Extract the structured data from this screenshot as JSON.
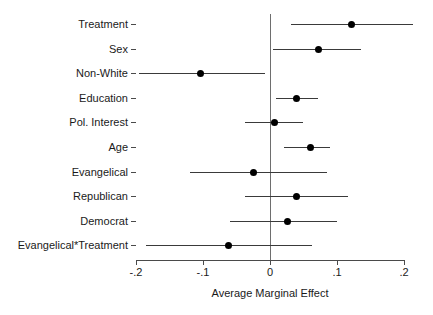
{
  "chart_data": {
    "type": "scatter",
    "title": "",
    "subtitle": "",
    "xlabel": "Average Marginal Effect",
    "ylabel": "",
    "xlim": [
      -0.2,
      0.2
    ],
    "xticks": [
      -0.2,
      -0.1,
      0,
      0.1,
      0.2
    ],
    "xticklabels": [
      "-.2",
      "-.1",
      "0",
      ".1",
      ".2"
    ],
    "grid": false,
    "legend": null,
    "annotations": [
      "vertical reference line at x = 0"
    ],
    "marker_color": "#000000",
    "line_color": "#3a3a3a",
    "axis_color": "#4a4a4a",
    "categories": [
      "Treatment",
      "Sex",
      "Non-White",
      "Education",
      "Pol. Interest",
      "Age",
      "Evangelical",
      "Republican",
      "Democrat",
      "Evangelical*Treatment"
    ],
    "series": [
      {
        "name": "Average Marginal Effect",
        "values": [
          0.122,
          0.072,
          -0.103,
          0.039,
          0.007,
          0.06,
          -0.024,
          0.04,
          0.026,
          -0.062
        ],
        "ci_low": [
          0.031,
          0.005,
          -0.196,
          0.009,
          -0.037,
          0.021,
          -0.12,
          -0.037,
          -0.059,
          -0.185
        ],
        "ci_high": [
          0.213,
          0.136,
          -0.007,
          0.071,
          0.049,
          0.09,
          0.085,
          0.116,
          0.1,
          0.062
        ]
      }
    ],
    "points": [
      {
        "label": "Treatment",
        "estimate": 0.122,
        "ci_low": 0.031,
        "ci_high": 0.213
      },
      {
        "label": "Sex",
        "estimate": 0.072,
        "ci_low": 0.005,
        "ci_high": 0.136
      },
      {
        "label": "Non-White",
        "estimate": -0.103,
        "ci_low": -0.196,
        "ci_high": -0.007
      },
      {
        "label": "Education",
        "estimate": 0.039,
        "ci_low": 0.009,
        "ci_high": 0.071
      },
      {
        "label": "Pol. Interest",
        "estimate": 0.007,
        "ci_low": -0.037,
        "ci_high": 0.049
      },
      {
        "label": "Age",
        "estimate": 0.06,
        "ci_low": 0.021,
        "ci_high": 0.09
      },
      {
        "label": "Evangelical",
        "estimate": -0.024,
        "ci_low": -0.12,
        "ci_high": 0.085
      },
      {
        "label": "Republican",
        "estimate": 0.04,
        "ci_low": -0.037,
        "ci_high": 0.116
      },
      {
        "label": "Democrat",
        "estimate": 0.026,
        "ci_low": -0.059,
        "ci_high": 0.1
      },
      {
        "label": "Evangelical*Treatment",
        "estimate": -0.062,
        "ci_low": -0.185,
        "ci_high": 0.062
      }
    ]
  }
}
